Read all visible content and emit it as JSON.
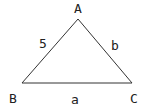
{
  "diagram": {
    "type": "triangle",
    "colors": {
      "stroke": "#333333",
      "text": "#222222",
      "background": "#ffffff"
    },
    "vertices": [
      {
        "id": "A",
        "label": "A",
        "x": 78,
        "y": 19,
        "label_x": 78,
        "label_y": 13
      },
      {
        "id": "B",
        "label": "B",
        "x": 22,
        "y": 83,
        "label_x": 13,
        "label_y": 103
      },
      {
        "id": "C",
        "label": "C",
        "x": 132,
        "y": 83,
        "label_x": 134,
        "label_y": 103
      }
    ],
    "sides": [
      {
        "id": "AB",
        "label": "5",
        "label_x": 43,
        "label_y": 48
      },
      {
        "id": "AC",
        "label": "b",
        "label_x": 115,
        "label_y": 50
      },
      {
        "id": "BC",
        "label": "a",
        "label_x": 75,
        "label_y": 104
      }
    ]
  }
}
